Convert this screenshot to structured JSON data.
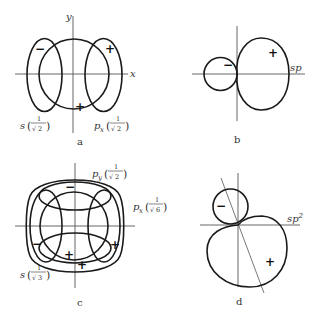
{
  "figure": {
    "panels": [
      {
        "id": "a",
        "caption": "a",
        "axis_labels": {
          "x": "x",
          "y": "y"
        },
        "orbitals": [
          {
            "name": "s",
            "coef_num": "1",
            "coef_den": "2"
          },
          {
            "name": "p",
            "subscript": "x",
            "coef_num": "1",
            "coef_den": "2"
          }
        ],
        "signs": [
          "−",
          "+",
          "+"
        ]
      },
      {
        "id": "b",
        "caption": "b",
        "hybrid_label": "sp",
        "signs": [
          "−",
          "+"
        ]
      },
      {
        "id": "c",
        "caption": "c",
        "orbitals": [
          {
            "name": "p",
            "subscript": "y",
            "coef_num": "1",
            "coef_den": "2"
          },
          {
            "name": "p",
            "subscript": "x",
            "coef_num": "1",
            "coef_den": "6"
          },
          {
            "name": "s",
            "coef_num": "1",
            "coef_den": "3"
          }
        ],
        "signs": [
          "−",
          "−",
          "+",
          "+",
          "+"
        ]
      },
      {
        "id": "d",
        "caption": "d",
        "hybrid_label": "sp",
        "hybrid_superscript": "2",
        "signs": [
          "−",
          "+"
        ]
      }
    ],
    "sqrt_symbol": "√",
    "open_paren": "(",
    "close_paren": ")"
  }
}
